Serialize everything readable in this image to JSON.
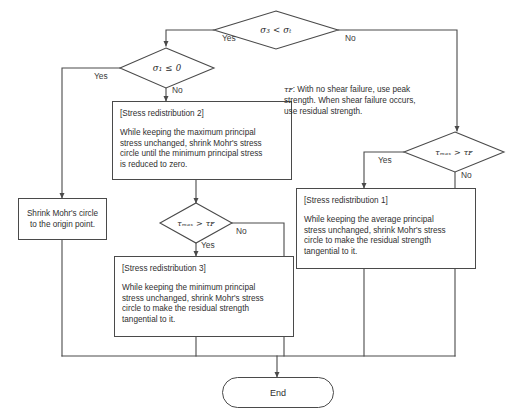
{
  "diagram": {
    "type": "flowchart",
    "line_color": "#4a4a4a",
    "text_color": "#2f2f2f",
    "background": "#ffffff"
  },
  "decisions": {
    "d1": {
      "name": "tensile-check",
      "text": "σ₃ < σₜ",
      "yes": "Yes",
      "no": "No"
    },
    "d2": {
      "name": "major-principal-check",
      "text": "σ₁ ≤ 0",
      "yes": "Yes",
      "no": "No"
    },
    "d3": {
      "name": "shear-check-left",
      "text": "τₘₐₓ > τꜰ",
      "yes": "Yes",
      "no": "No"
    },
    "d4": {
      "name": "shear-check-right",
      "text": "τₘₐₓ > τꜰ",
      "yes": "Yes",
      "no": "No"
    }
  },
  "processes": {
    "redistribution2": {
      "title": "[Stress redistribution 2]",
      "lines": [
        "While keeping the maximum principal",
        "stress unchanged, shrink Mohr's stress",
        "circle until the minimum principal stress",
        "is reduced to zero."
      ]
    },
    "redistribution3": {
      "title": "[Stress redistribution 3]",
      "lines": [
        "While keeping the minimum principal",
        "stress unchanged, shrink Mohr's stress",
        "circle to make the residual strength",
        "tangential to it."
      ]
    },
    "redistribution1": {
      "title": "[Stress redistribution 1]",
      "lines": [
        "While keeping the average principal",
        "stress unchanged, shrink Mohr's stress",
        "circle to make the residual strength",
        "tangential to it."
      ]
    },
    "shrink_origin": {
      "lines": [
        "Shrink Mohr's circle",
        "to the origin point."
      ]
    }
  },
  "note": {
    "symbol": "τꜰ",
    "lines": [
      ": With no shear failure, use peak",
      "strength. When shear failure occurs,",
      "use residual strength."
    ]
  },
  "terminator": {
    "end_label": "End"
  },
  "edge_labels": {
    "d1_yes": "Yes",
    "d1_no": "No",
    "d2_yes": "Yes",
    "d2_no": "No",
    "d3_yes": "Yes",
    "d3_no": "No",
    "d4_yes": "Yes",
    "d4_no": "No"
  }
}
